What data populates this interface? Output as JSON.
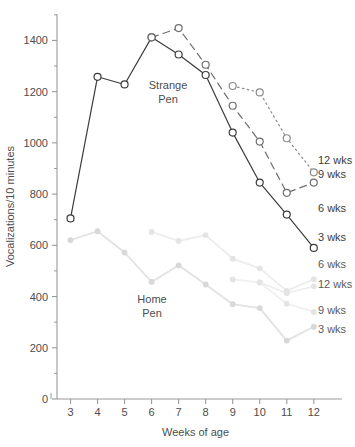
{
  "chart_data": {
    "type": "line",
    "title": "",
    "xlabel": "Weeks of age",
    "ylabel": "Vocalizations/10 minutes",
    "x": [
      3,
      4,
      5,
      6,
      7,
      8,
      9,
      10,
      11,
      12
    ],
    "xlim": [
      2.5,
      12.6
    ],
    "ylim": [
      0,
      1500
    ],
    "yticks": [
      0,
      200,
      400,
      600,
      800,
      1000,
      1200,
      1400
    ],
    "yticks_minor": [
      100,
      300,
      500,
      700,
      900,
      1100,
      1300,
      1500
    ],
    "xticks": [
      3,
      4,
      5,
      6,
      7,
      8,
      9,
      10,
      11,
      12
    ],
    "grid": false,
    "legend_position": "right-inline",
    "group_annotations": [
      {
        "text_line1": "Strange",
        "text_line2": "Pen",
        "x_px": 168,
        "y_px": 89
      },
      {
        "text_line1": "Home",
        "text_line2": "Pen",
        "x_px": 152,
        "y_px": 303
      }
    ],
    "series": [
      {
        "name": "Strange Pen 3 wks",
        "label": "3 wks",
        "group": "Strange Pen",
        "style": "solid",
        "color": "#3c3c3c",
        "marker": "open-circle",
        "x": [
          3,
          4,
          5,
          6,
          7,
          8,
          9,
          10,
          11,
          12
        ],
        "values": [
          705,
          1258,
          1228,
          1412,
          1345,
          1265,
          1040,
          845,
          720,
          590
        ]
      },
      {
        "name": "Strange Pen 9 wks",
        "label": "9 wks",
        "group": "Strange Pen",
        "style": "dashed",
        "color": "#6e6e6e",
        "marker": "open-circle",
        "x": [
          6,
          7,
          8,
          9,
          10,
          11,
          12
        ],
        "values": [
          1412,
          1448,
          1305,
          1145,
          1005,
          805,
          845
        ]
      },
      {
        "name": "Strange Pen 12 wks",
        "label": "12 wks",
        "group": "Strange Pen",
        "style": "dotted",
        "color": "#8a8a8a",
        "marker": "open-circle",
        "x": [
          9,
          10,
          11,
          12
        ],
        "values": [
          1222,
          1197,
          1018,
          885
        ]
      },
      {
        "name": "Home Pen 3 wks",
        "label": "3 wks",
        "group": "Home Pen",
        "style": "solid",
        "color": "#e2e2e2",
        "marker": "filled-circle",
        "x": [
          3,
          4,
          5,
          6,
          7,
          8,
          9,
          10,
          11,
          12
        ],
        "values": [
          620,
          655,
          572,
          457,
          522,
          447,
          370,
          355,
          228,
          282
        ]
      },
      {
        "name": "Home Pen 6 wks",
        "label": "6 wks",
        "group": "Home Pen",
        "style": "solid",
        "color": "#ececec",
        "marker": "filled-circle",
        "x": [
          6,
          7,
          8,
          9,
          10,
          11,
          12
        ],
        "values": [
          652,
          617,
          640,
          548,
          510,
          422,
          468
        ]
      },
      {
        "name": "Home Pen 9 wks",
        "label": "9 wks",
        "group": "Home Pen",
        "style": "solid",
        "color": "#f0f0f0",
        "marker": "filled-circle",
        "x": [
          9,
          10,
          11,
          12
        ],
        "values": [
          467,
          455,
          372,
          340
        ]
      },
      {
        "name": "Home Pen 12 wks",
        "label": "12 wks",
        "group": "Home Pen",
        "style": "solid",
        "color": "#eeeeee",
        "marker": "filled-circle",
        "x": [
          10,
          11,
          12
        ],
        "values": [
          455,
          413,
          440
        ]
      }
    ],
    "inline_legend": [
      {
        "label": "12 wks",
        "x_px": 318,
        "y_px": 164,
        "tone": "dark"
      },
      {
        "label": "9 wks",
        "x_px": 318,
        "y_px": 178,
        "tone": "dark"
      },
      {
        "label": "6 wks",
        "x_px": 318,
        "y_px": 212,
        "tone": "dark"
      },
      {
        "label": "3 wks",
        "x_px": 318,
        "y_px": 241,
        "tone": "dark"
      },
      {
        "label": "6 wks",
        "x_px": 318,
        "y_px": 268,
        "tone": "light"
      },
      {
        "label": "12 wks",
        "x_px": 318,
        "y_px": 288,
        "tone": "light"
      },
      {
        "label": "9 wks",
        "x_px": 318,
        "y_px": 314,
        "tone": "light"
      },
      {
        "label": "3 wks",
        "x_px": 318,
        "y_px": 333,
        "tone": "light"
      }
    ]
  },
  "axis": {
    "y_title": "Vocalizations/10 minutes",
    "x_title": "Weeks of age",
    "y_tick_labels": [
      "1400",
      "1200",
      "1000",
      "800",
      "600",
      "400",
      "200",
      "0"
    ],
    "x_tick_labels": [
      "3",
      "4",
      "5",
      "6",
      "7",
      "8",
      "9",
      "10",
      "11",
      "12"
    ]
  },
  "colors": {
    "axis": "#9a9a9a",
    "text": "#4d4d4d",
    "dark_series": "#3c3c3c",
    "mid_series": "#6e6e6e",
    "light_series": "#8a8a8a",
    "pale_series": "#e6e6e6",
    "background": "#ffffff"
  }
}
